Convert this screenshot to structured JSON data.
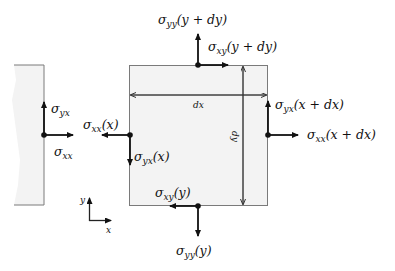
{
  "colors": {
    "element_fill": "#f3f3f3",
    "element_stroke": "#7a7a7a",
    "arrow": "#111111",
    "dimension": "#333333"
  },
  "left_element": {
    "labels": {
      "shear": {
        "symbol": "σ",
        "sub": "yx",
        "arg": ""
      },
      "normal": {
        "symbol": "σ",
        "sub": "xx",
        "arg": ""
      }
    }
  },
  "element": {
    "dimensions": {
      "width_label": "dx",
      "height_label": "dy"
    },
    "labels": {
      "top_normal": {
        "symbol": "σ",
        "sub": "yy",
        "arg": "(y + dy)"
      },
      "top_shear": {
        "symbol": "σ",
        "sub": "xy",
        "arg": "(y + dy)"
      },
      "left_normal": {
        "symbol": "σ",
        "sub": "xx",
        "arg": "(x)"
      },
      "left_shear": {
        "symbol": "σ",
        "sub": "yx",
        "arg": "(x)"
      },
      "right_shear": {
        "symbol": "σ",
        "sub": "yx",
        "arg": "(x + dx)"
      },
      "right_normal": {
        "symbol": "σ",
        "sub": "xx",
        "arg": "(x + dx)"
      },
      "bottom_shear": {
        "symbol": "σ",
        "sub": "xy",
        "arg": "(y)"
      },
      "bottom_normal": {
        "symbol": "σ",
        "sub": "yy",
        "arg": "(y)"
      }
    }
  },
  "axes": {
    "x_label": "x",
    "y_label": "y"
  }
}
